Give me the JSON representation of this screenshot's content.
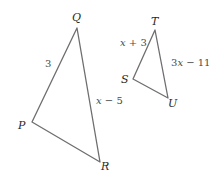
{
  "figure": {
    "stroke_color": "#6e6e6e",
    "label_color": "#2a2a2a"
  },
  "triangle_pqr": {
    "name": "PQR",
    "vertices": {
      "Q": {
        "label": "Q",
        "x": 77,
        "y": 28
      },
      "P": {
        "label": "P",
        "x": 32,
        "y": 122
      },
      "R": {
        "label": "R",
        "x": 100,
        "y": 162
      }
    },
    "sides": {
      "PQ": {
        "label": "3"
      },
      "QR": {
        "label_var": "x",
        "label_rest": " − 5",
        "label": "x − 5"
      }
    }
  },
  "triangle_stu": {
    "name": "STU",
    "vertices": {
      "T": {
        "label": "T",
        "x": 155,
        "y": 30
      },
      "S": {
        "label": "S",
        "x": 133,
        "y": 79
      },
      "U": {
        "label": "U",
        "x": 168,
        "y": 98
      }
    },
    "sides": {
      "ST": {
        "label_var": "x",
        "label_rest": " + 3",
        "label": "x + 3"
      },
      "TU": {
        "label_pre": "3",
        "label_var": "x",
        "label_rest": " − 11",
        "label": "3x − 11"
      }
    }
  }
}
